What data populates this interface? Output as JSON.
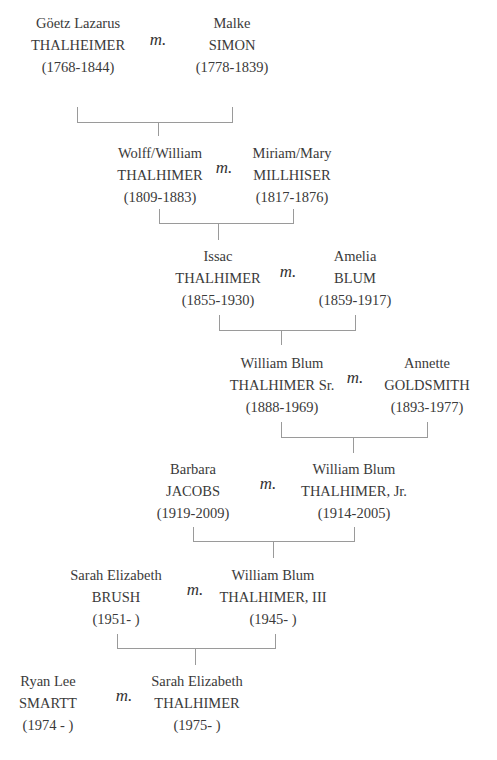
{
  "marriage_label": "m.",
  "generations": [
    {
      "left": {
        "given": "Göetz Lazarus",
        "surname": "THALHEIMER",
        "dates": "(1768-1844)"
      },
      "right": {
        "given": "Malke",
        "surname": "SIMON",
        "dates": "(1778-1839)"
      }
    },
    {
      "left": {
        "given": "Wolff/William",
        "surname": "THALHIMER",
        "dates": "(1809-1883)"
      },
      "right": {
        "given": "Miriam/Mary",
        "surname": "MILLHISER",
        "dates": "(1817-1876)"
      }
    },
    {
      "left": {
        "given": "Issac",
        "surname": "THALHIMER",
        "dates": "(1855-1930)"
      },
      "right": {
        "given": "Amelia",
        "surname": "BLUM",
        "dates": "(1859-1917)"
      }
    },
    {
      "left": {
        "given": "William Blum",
        "surname": "THALHIMER Sr.",
        "dates": "(1888-1969)"
      },
      "right": {
        "given": "Annette",
        "surname": "GOLDSMITH",
        "dates": "(1893-1977)"
      }
    },
    {
      "left": {
        "given": "Barbara",
        "surname": "JACOBS",
        "dates": "(1919-2009)"
      },
      "right": {
        "given": "William Blum",
        "surname": "THALHIMER, Jr.",
        "dates": "(1914-2005)"
      }
    },
    {
      "left": {
        "given": "Sarah Elizabeth",
        "surname": "BRUSH",
        "dates": "(1951-  )"
      },
      "right": {
        "given": "William Blum",
        "surname": "THALHIMER, III",
        "dates": "(1945-  )"
      }
    },
    {
      "left": {
        "given": "Ryan Lee",
        "surname": "SMARTT",
        "dates": "(1974 -  )"
      },
      "right": {
        "given": "Sarah Elizabeth",
        "surname": "THALHIMER",
        "dates": "(1975-  )"
      }
    }
  ]
}
